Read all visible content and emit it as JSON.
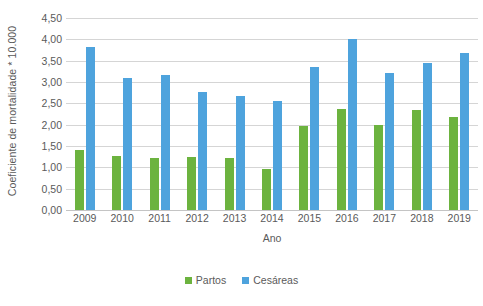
{
  "chart_data": {
    "type": "bar",
    "title": "",
    "xlabel": "Ano",
    "ylabel": "Coeficiente de mortalidade * 10.000",
    "categories": [
      "2009",
      "2010",
      "2011",
      "2012",
      "2013",
      "2014",
      "2015",
      "2016",
      "2017",
      "2018",
      "2019"
    ],
    "series": [
      {
        "name": "Partos",
        "color": "#6cb33f",
        "values": [
          1.4,
          1.26,
          1.22,
          1.25,
          1.23,
          0.95,
          1.98,
          2.37,
          2.0,
          2.35,
          2.18
        ]
      },
      {
        "name": "Cesáreas",
        "color": "#4ea3dd",
        "values": [
          3.83,
          3.1,
          3.17,
          2.77,
          2.68,
          2.55,
          3.35,
          4.0,
          3.22,
          3.45,
          3.67
        ]
      }
    ],
    "ylim": [
      0.0,
      4.5
    ],
    "ytick_labels": [
      "0,00",
      "0,50",
      "1,00",
      "1,50",
      "2,00",
      "2,50",
      "3,00",
      "3,50",
      "4,00",
      "4,50"
    ],
    "ytick_values": [
      0.0,
      0.5,
      1.0,
      1.5,
      2.0,
      2.5,
      3.0,
      3.5,
      4.0,
      4.5
    ],
    "grid": true,
    "legend_position": "bottom",
    "background": "#ffffff",
    "gridline_color": "#d5d5d5"
  }
}
